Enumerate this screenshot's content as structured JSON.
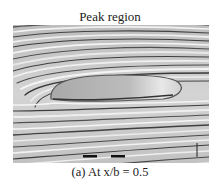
{
  "figure": {
    "title": "Peak region",
    "caption": "(a) At x/b = 0.5",
    "visual": "grayscale surface streamline visualization",
    "features": {
      "separation_region": "smooth elongated gray bubble at center",
      "markers": [
        "black dash marker left",
        "black dash marker center",
        "vertical tick near right edge"
      ]
    }
  }
}
